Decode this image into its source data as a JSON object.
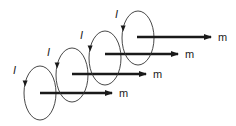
{
  "diagram": {
    "loops": [
      {
        "current_label": "I",
        "moment_label": "m",
        "cx": 40,
        "cy": 93,
        "rx": 16,
        "ry": 27,
        "arrow_x1": 40,
        "arrow_x2": 112,
        "arrow_y": 93,
        "m_x": 119,
        "m_y": 97,
        "i_x": 13,
        "i_y": 74
      },
      {
        "current_label": "I",
        "moment_label": "m",
        "cx": 72,
        "cy": 75,
        "rx": 16,
        "ry": 27,
        "arrow_x1": 72,
        "arrow_x2": 146,
        "arrow_y": 74,
        "m_x": 153,
        "m_y": 78,
        "i_x": 47,
        "i_y": 56
      },
      {
        "current_label": "I",
        "moment_label": "m",
        "cx": 105,
        "cy": 58,
        "rx": 16,
        "ry": 27,
        "arrow_x1": 105,
        "arrow_x2": 178,
        "arrow_y": 54,
        "m_x": 185,
        "m_y": 58,
        "i_x": 80,
        "i_y": 39
      },
      {
        "current_label": "I",
        "moment_label": "m",
        "cx": 138,
        "cy": 38,
        "rx": 16,
        "ry": 27,
        "arrow_x1": 137,
        "arrow_x2": 211,
        "arrow_y": 37,
        "m_x": 218,
        "m_y": 41,
        "i_x": 115,
        "i_y": 18
      }
    ],
    "colors": {
      "stroke": "#333333",
      "arrow": "#1a1a1a"
    }
  }
}
